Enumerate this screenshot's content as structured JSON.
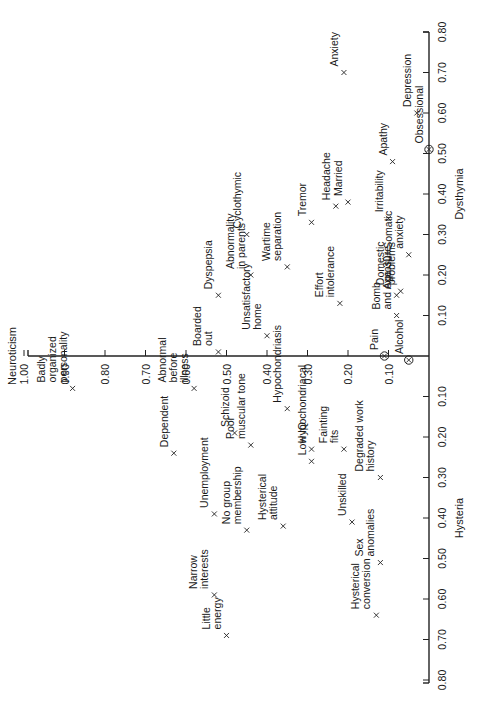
{
  "chart_data": {
    "type": "scatter",
    "title": "",
    "orientation_note": "figure printed rotated 90 degrees counter-clockwise",
    "axes": {
      "vertical": {
        "label": "Neuroticism",
        "ticks": [
          "1.00",
          "0.90",
          "0.80",
          "0.70",
          "0.60",
          "0.50",
          "0.40",
          "0.30",
          "0.20",
          "0.10"
        ],
        "range": [
          0,
          1.0
        ]
      },
      "horizontal_positive": {
        "label": "Dysthymia",
        "ticks": [
          "0.10",
          "0.20",
          "0.30",
          "0.40",
          "0.50",
          "0.60",
          "0.70",
          "0.80"
        ],
        "range": [
          0,
          0.8
        ]
      },
      "horizontal_negative": {
        "label": "Hysteria",
        "ticks": [
          "0.10",
          "0.20",
          "0.30",
          "0.40",
          "0.50",
          "0.60",
          "0.70",
          "0.80"
        ],
        "range": [
          0,
          0.8
        ]
      }
    },
    "grid": false,
    "legend": null,
    "marker_note": "circled markers (⊗) for Obsessional, Pain, Alcohol; × for others",
    "points": [
      {
        "label": "Anxiety",
        "lines": [
          "× Anxiety"
        ],
        "neuroticism": 0.21,
        "dysthymia_hysteria": 0.7,
        "marker": "x"
      },
      {
        "label": "Depression",
        "lines": [
          "Depression"
        ],
        "neuroticism": 0.03,
        "dysthymia_hysteria": 0.6,
        "marker": "x"
      },
      {
        "label": "Obsessional",
        "lines": [
          "Obsessional"
        ],
        "neuroticism": 0.0,
        "dysthymia_hysteria": 0.51,
        "marker": "circle"
      },
      {
        "label": "Apathy",
        "lines": [
          "× Apathy"
        ],
        "neuroticism": 0.09,
        "dysthymia_hysteria": 0.48,
        "marker": "x"
      },
      {
        "label": "Married",
        "lines": [
          "× Married"
        ],
        "neuroticism": 0.2,
        "dysthymia_hysteria": 0.38,
        "marker": "x"
      },
      {
        "label": "Irritability",
        "lines": [
          "Irritability ×"
        ],
        "neuroticism": 0.1,
        "dysthymia_hysteria": 0.34,
        "marker": "x"
      },
      {
        "label": "Headache",
        "lines": [
          "Headache ×"
        ],
        "neuroticism": 0.23,
        "dysthymia_hysteria": 0.37,
        "marker": "x"
      },
      {
        "label": "Tremor",
        "lines": [
          "× Tremor"
        ],
        "neuroticism": 0.29,
        "dysthymia_hysteria": 0.33,
        "marker": "x"
      },
      {
        "label": "Cyclothymic",
        "lines": [
          "× Cyclothymic"
        ],
        "neuroticism": 0.45,
        "dysthymia_hysteria": 0.3,
        "marker": "x"
      },
      {
        "label": "Wartime separation",
        "lines": [
          "Wartime",
          "separation"
        ],
        "neuroticism": 0.35,
        "dysthymia_hysteria": 0.22,
        "marker": "x"
      },
      {
        "label": "Somatic anxiety",
        "lines": [
          "Somatic",
          "anxiety"
        ],
        "neuroticism": 0.05,
        "dysthymia_hysteria": 0.25,
        "marker": "x"
      },
      {
        "label": "Dyspepsia",
        "lines": [
          "× Dyspepsia"
        ],
        "neuroticism": 0.52,
        "dysthymia_hysteria": 0.15,
        "marker": "x"
      },
      {
        "label": "Abnormality in parents",
        "lines": [
          "Abnormality",
          "in parents ×"
        ],
        "neuroticism": 0.44,
        "dysthymia_hysteria": 0.2,
        "marker": "x"
      },
      {
        "label": "Domestic problems",
        "lines": [
          "Domestic",
          "problems"
        ],
        "neuroticism": 0.07,
        "dysthymia_hysteria": 0.16,
        "marker": "x"
      },
      {
        "label": "Age 30+",
        "lines": [
          "Age 30+"
        ],
        "neuroticism": 0.08,
        "dysthymia_hysteria": 0.15,
        "marker": "x"
      },
      {
        "label": "Effort intolerance",
        "lines": [
          "Effort",
          "intolerance"
        ],
        "neuroticism": 0.22,
        "dysthymia_hysteria": 0.13,
        "marker": "x"
      },
      {
        "label": "Bomb and exposure",
        "lines": [
          "Bomb",
          "and exposure"
        ],
        "neuroticism": 0.08,
        "dysthymia_hysteria": 0.1,
        "marker": "x"
      },
      {
        "label": "Boarded out",
        "lines": [
          "Boarded",
          "× out"
        ],
        "neuroticism": 0.52,
        "dysthymia_hysteria": 0.01,
        "marker": "x"
      },
      {
        "label": "Unsatisfactory home",
        "lines": [
          "Unsatisfactory",
          "home"
        ],
        "neuroticism": 0.4,
        "dysthymia_hysteria": 0.05,
        "marker": "x"
      },
      {
        "label": "Pain",
        "lines": [
          "Pain"
        ],
        "neuroticism": 0.11,
        "dysthymia_hysteria": 0.0,
        "marker": "circle"
      },
      {
        "label": "Alcohol",
        "lines": [
          "Alcohol"
        ],
        "neuroticism": 0.05,
        "dysthymia_hysteria": -0.01,
        "marker": "circle"
      },
      {
        "label": "Badly organized personality",
        "lines": [
          "Badly",
          "organized ×",
          "personality"
        ],
        "neuroticism": 0.88,
        "dysthymia_hysteria": -0.08,
        "marker": "x"
      },
      {
        "label": "Abnormal before illness",
        "lines": [
          "Abnormal",
          "before ×",
          "illness"
        ],
        "neuroticism": 0.58,
        "dysthymia_hysteria": -0.08,
        "marker": "x"
      },
      {
        "label": "Dependent",
        "lines": [
          "Dependent ×"
        ],
        "neuroticism": 0.63,
        "dysthymia_hysteria": -0.24,
        "marker": "x"
      },
      {
        "label": "Schizoid",
        "lines": [
          "Schizoid ×"
        ],
        "neuroticism": 0.48,
        "dysthymia_hysteria": -0.19,
        "marker": "x"
      },
      {
        "label": "Poor muscular tone",
        "lines": [
          "Poor ×",
          "muscular tone"
        ],
        "neuroticism": 0.44,
        "dysthymia_hysteria": -0.22,
        "marker": "x"
      },
      {
        "label": "Hypochondriasis",
        "lines": [
          "Hypochondriasis"
        ],
        "neuroticism": 0.35,
        "dysthymia_hysteria": -0.13,
        "marker": "x"
      },
      {
        "label": "Hypochondriacal",
        "lines": [
          "Hypochondriacal"
        ],
        "neuroticism": 0.29,
        "dysthymia_hysteria": -0.23,
        "marker": "x"
      },
      {
        "label": "Low IQ",
        "lines": [
          "Low IQ"
        ],
        "neuroticism": 0.29,
        "dysthymia_hysteria": -0.26,
        "marker": "x"
      },
      {
        "label": "Unemployment",
        "lines": [
          "Unemployment ×"
        ],
        "neuroticism": 0.53,
        "dysthymia_hysteria": -0.39,
        "marker": "x"
      },
      {
        "label": "Fainting fits",
        "lines": [
          "Fainting",
          "fits"
        ],
        "neuroticism": 0.21,
        "dysthymia_hysteria": -0.23,
        "marker": "x"
      },
      {
        "label": "Degraded work history",
        "lines": [
          "Degraded work",
          "history"
        ],
        "neuroticism": 0.12,
        "dysthymia_hysteria": -0.3,
        "marker": "x"
      },
      {
        "label": "No group membership",
        "lines": [
          "No group ×",
          "membership"
        ],
        "neuroticism": 0.45,
        "dysthymia_hysteria": -0.43,
        "marker": "x"
      },
      {
        "label": "Hysterical attitude",
        "lines": [
          "Hysterical",
          "attitude"
        ],
        "neuroticism": 0.36,
        "dysthymia_hysteria": -0.42,
        "marker": "x"
      },
      {
        "label": "Unskilled",
        "lines": [
          "Unskilled"
        ],
        "neuroticism": 0.19,
        "dysthymia_hysteria": -0.41,
        "marker": "x"
      },
      {
        "label": "Sex anomalies",
        "lines": [
          "Sex",
          "anomalies"
        ],
        "neuroticism": 0.12,
        "dysthymia_hysteria": -0.51,
        "marker": "x"
      },
      {
        "label": "Narrow interests",
        "lines": [
          "Narrow",
          "interests"
        ],
        "neuroticism": 0.53,
        "dysthymia_hysteria": -0.59,
        "marker": "x"
      },
      {
        "label": "Little energy",
        "lines": [
          "Little",
          "energy"
        ],
        "neuroticism": 0.5,
        "dysthymia_hysteria": -0.69,
        "marker": "x"
      },
      {
        "label": "Hysterical conversion",
        "lines": [
          "Hysterical ×",
          "conversion"
        ],
        "neuroticism": 0.13,
        "dysthymia_hysteria": -0.64,
        "marker": "x"
      }
    ]
  }
}
